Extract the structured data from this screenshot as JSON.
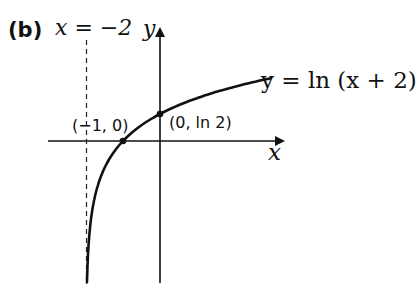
{
  "figure": {
    "part_label": "(b)",
    "asymptote_label": "x = −2",
    "y_axis_label": "y",
    "x_axis_label": "x",
    "curve_equation": "y = ln (x + 2)",
    "points": [
      {
        "label": "(−1, 0)",
        "x": -1,
        "y": 0
      },
      {
        "label": "(0, ln 2)",
        "x": 0,
        "y": 0.693
      }
    ],
    "asymptote": {
      "type": "vertical",
      "x": -2,
      "style": "dashed"
    },
    "colors": {
      "ink": "#111111",
      "background": "#ffffff"
    }
  }
}
